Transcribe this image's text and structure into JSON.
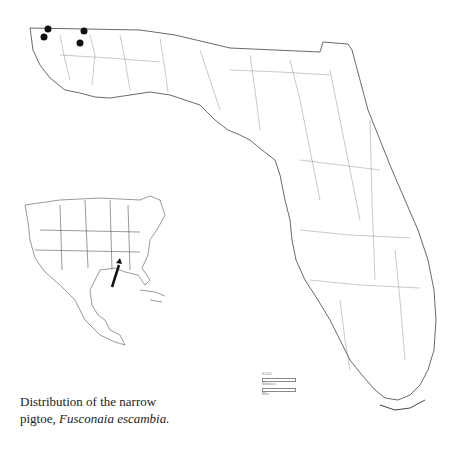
{
  "figure": {
    "caption_line1": "Distribution of the narrow",
    "caption_line2_prefix": "pigtoe, ",
    "caption_species": "Fusconaia escambia.",
    "main_map": "Florida",
    "inset_map": "North America / Caribbean locator",
    "inset_arrow_target": "Florida panhandle",
    "scale": {
      "title": "SCALE",
      "units": [
        "Kilometers",
        "Miles"
      ]
    },
    "occurrence_points": [
      {
        "x": 48,
        "y": 29
      },
      {
        "x": 44,
        "y": 37
      },
      {
        "x": 84,
        "y": 31
      },
      {
        "x": 80,
        "y": 43
      }
    ],
    "colors": {
      "ink": "#222222",
      "background": "#ffffff"
    }
  }
}
